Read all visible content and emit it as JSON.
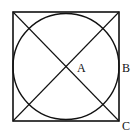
{
  "diagram": {
    "type": "geometry",
    "shapes": {
      "square": {
        "x": 13,
        "y": 12,
        "width": 106,
        "height": 109
      },
      "circle": {
        "cx": 66,
        "cy": 66.5,
        "r": 53
      },
      "diagonals": [
        {
          "from": "top-left",
          "to": "bottom-right"
        },
        {
          "from": "bottom-left",
          "to": "top-right"
        }
      ]
    },
    "labels": {
      "a": "A",
      "b": "B",
      "c": "C"
    },
    "stroke_color": "#111111"
  }
}
